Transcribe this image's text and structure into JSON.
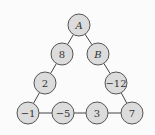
{
  "diagram": {
    "nodes": [
      {
        "id": "A",
        "label": "A",
        "italic": true,
        "x": 79,
        "y": 25
      },
      {
        "id": "n8",
        "label": "8",
        "italic": false,
        "x": 62,
        "y": 54
      },
      {
        "id": "B",
        "label": "B",
        "italic": true,
        "x": 98,
        "y": 54
      },
      {
        "id": "n2",
        "label": "2",
        "italic": false,
        "x": 45,
        "y": 83
      },
      {
        "id": "n-12",
        "label": "−12",
        "italic": false,
        "x": 116,
        "y": 83
      },
      {
        "id": "n-1",
        "label": "−1",
        "italic": false,
        "x": 28,
        "y": 113
      },
      {
        "id": "n-5",
        "label": "−5",
        "italic": false,
        "x": 63,
        "y": 113
      },
      {
        "id": "n3",
        "label": "3",
        "italic": false,
        "x": 97,
        "y": 113
      },
      {
        "id": "n7",
        "label": "7",
        "italic": false,
        "x": 132,
        "y": 113
      }
    ],
    "edges": [
      [
        "A",
        "n8"
      ],
      [
        "n8",
        "n2"
      ],
      [
        "n2",
        "n-1"
      ],
      [
        "A",
        "B"
      ],
      [
        "B",
        "n-12"
      ],
      [
        "n-12",
        "n7"
      ],
      [
        "n-1",
        "n-5"
      ],
      [
        "n-5",
        "n3"
      ],
      [
        "n3",
        "n7"
      ]
    ]
  }
}
